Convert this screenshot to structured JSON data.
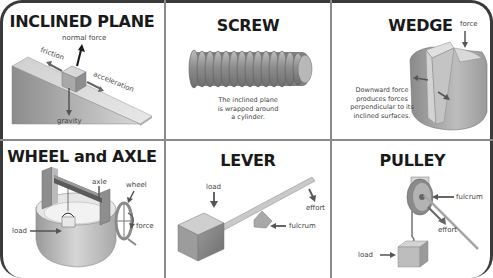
{
  "panels": {
    "inclined_plane": {
      "title": "INCLINED PLANE",
      "labels": {
        "normal_force": "normal force",
        "friction": "friction",
        "acceleration": "acceleration",
        "gravity": "gravity"
      }
    },
    "screw": {
      "title": "SCREW",
      "caption": [
        "The inclined plane",
        "is wrapped around",
        "a cylinder."
      ]
    },
    "wedge": {
      "title": "WEDGE",
      "labels": {
        "force": "force"
      },
      "caption": [
        "Downward force",
        "produces forces",
        "perpendicular to its",
        "inclined surfaces."
      ]
    },
    "wheel_and_axle": {
      "title": "WHEEL and AXLE",
      "labels": {
        "axle": "axle",
        "wheel": "wheel",
        "load": "load",
        "force": "force"
      }
    },
    "lever": {
      "title": "LEVER",
      "labels": {
        "load": "load",
        "effort": "effort",
        "fulcrum": "fulcrum"
      }
    },
    "pulley": {
      "title": "PULLEY",
      "labels": {
        "fulcrum": "fulcrum",
        "effort": "effort",
        "load": "load"
      }
    }
  },
  "colors": {
    "frame": "#3a3a3a",
    "divider": "#8a8a8a",
    "title": "#1a1a1a",
    "label": "#444444",
    "object_light": "#c8c8c8",
    "object_dark": "#7a7a7a"
  }
}
